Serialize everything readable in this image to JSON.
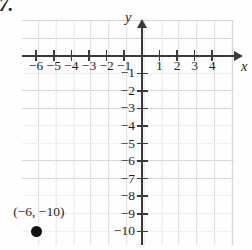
{
  "figure": {
    "problem_number": "7.",
    "x_axis_label": "x",
    "y_axis_label": "y",
    "point_label": "(−6, −10)"
  },
  "chart_data": {
    "type": "scatter",
    "title": "",
    "xlabel": "x",
    "ylabel": "y",
    "grid": true,
    "legend": null,
    "xlim": [
      -7,
      5
    ],
    "ylim": [
      -11,
      1
    ],
    "x_ticks": [
      -6,
      -5,
      -4,
      -3,
      -2,
      -1,
      1,
      2,
      3,
      4
    ],
    "x_tick_labels": [
      "−6",
      "−5",
      "−4",
      "−3",
      "−2",
      "−1",
      "1",
      "2",
      "3",
      "4"
    ],
    "y_ticks": [
      -1,
      -2,
      -3,
      -4,
      -5,
      -6,
      -7,
      -8,
      -9,
      -10
    ],
    "y_tick_labels": [
      "−1",
      "−2",
      "−3",
      "−4",
      "−5",
      "−6",
      "−7",
      "−8",
      "−9",
      "−10"
    ],
    "points": [
      {
        "x": -6,
        "y": -10,
        "label": "(−6, −10)",
        "marker": "filled-circle"
      }
    ],
    "colors": {
      "axis": "#3a3a3a",
      "grid": "#8c8c96",
      "marker": "#111111",
      "text": "#1f1f1f"
    }
  }
}
